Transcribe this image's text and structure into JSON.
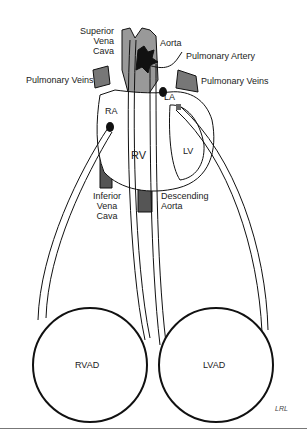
{
  "diagram": {
    "labels": {
      "superior_vena_cava": [
        "Superior",
        "Vena",
        "Cava"
      ],
      "aorta": "Aorta",
      "pulmonary_artery": "Pulmonary Artery",
      "pulmonary_veins_left": "Pulmonary Veins",
      "pulmonary_veins_right": "Pulmonary Veins",
      "ra": "RA",
      "la": "LA",
      "rv": "RV",
      "lv": "LV",
      "inferior_vena_cava": [
        "Inferior",
        "Vena",
        "Cava"
      ],
      "descending_aorta": [
        "Descending",
        "Aorta"
      ],
      "rvad": "RVAD",
      "lvad": "LVAD",
      "signature": "LRL"
    }
  }
}
